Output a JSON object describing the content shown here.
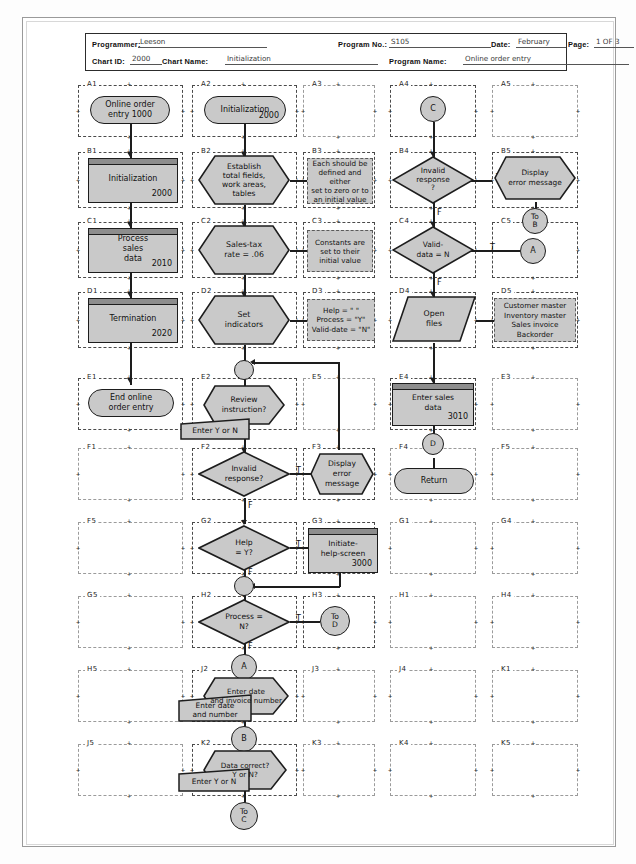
{
  "document": {
    "title": "Program Flowchart Worksheet",
    "sheet_border_color": "#9a9a9a"
  },
  "header": {
    "fields": [
      {
        "label": "Programmer:",
        "value": "Leeson"
      },
      {
        "label": "Program No.:",
        "value": "S105"
      },
      {
        "label": "Date:",
        "value": "February"
      },
      {
        "label": "Page:",
        "value": "1 OF 3"
      },
      {
        "label": "Chart ID:",
        "value": "2000"
      },
      {
        "label": "Chart Name:",
        "value": "Initialization"
      },
      {
        "label": "Program Name:",
        "value": "Online order entry"
      }
    ]
  },
  "palette": {
    "shape_fill": "#c9c9c9",
    "shape_stroke": "#1d1d1d",
    "header_bar": "#8d8d8d",
    "grid_dash": "#4a4a4a",
    "paper": "#ffffff"
  },
  "grid": {
    "rows": [
      "A",
      "B",
      "C",
      "D",
      "E",
      "F",
      "G",
      "H",
      "J",
      "K"
    ],
    "columns": [
      "1",
      "2",
      "3",
      "4",
      "5"
    ],
    "empty_cells": [
      "A3",
      "A5",
      "C5",
      "E3",
      "E5",
      "F1",
      "F5",
      "G1",
      "G4",
      "G5",
      "H1",
      "H4",
      "H5",
      "J1",
      "J3",
      "J4",
      "J5",
      "K1",
      "K3",
      "K4",
      "K5"
    ]
  },
  "shapes": {
    "a1": {
      "id": "A1",
      "type": "terminator",
      "text": "Online order\nentry 1000"
    },
    "b1": {
      "id": "B1",
      "type": "process",
      "text": "Initialization",
      "code": "2000"
    },
    "c1": {
      "id": "C1",
      "type": "process",
      "text": "Process\nsales\ndata",
      "code": "2010"
    },
    "d1": {
      "id": "D1",
      "type": "process",
      "text": "Termination",
      "code": "2020"
    },
    "e1": {
      "id": "E1",
      "type": "terminator",
      "text": "End online\norder entry"
    },
    "a2": {
      "id": "A2",
      "type": "terminator",
      "text": "Initialization",
      "code": "2000"
    },
    "b2": {
      "id": "B2",
      "type": "preparation",
      "text": "Establish\ntotal fields,\nwork areas,\ntables"
    },
    "b3": {
      "id": "B3",
      "type": "annotation",
      "text": "Each should be\ndefined and either\nset to zero or to\nan initial value"
    },
    "c2": {
      "id": "C2",
      "type": "preparation",
      "text": "Sales-tax\nrate = .06"
    },
    "c3": {
      "id": "C3",
      "type": "annotation",
      "text": "Constants are\nset to their\ninitial value"
    },
    "d2": {
      "id": "D2",
      "type": "preparation",
      "text": "Set\nindicators"
    },
    "d3": {
      "id": "D3",
      "type": "annotation",
      "text": "Help = \" \"\nProcess = \"Y\"\nValid-date = \"N\""
    },
    "e2": {
      "id": "E2",
      "type": "display",
      "text": "Review\ninstruction?"
    },
    "e2b": {
      "id": "E2-input",
      "type": "manual-input",
      "text": "Enter Y or N"
    },
    "f2": {
      "id": "F2",
      "type": "decision",
      "text": "Invalid\nresponse?"
    },
    "f3": {
      "id": "F3",
      "type": "display",
      "text": "Display\nerror\nmessage"
    },
    "g2": {
      "id": "G2",
      "type": "decision",
      "text": "Help\n= Y?"
    },
    "g3": {
      "id": "G3",
      "type": "process",
      "text": "Initiate-\nhelp-screen",
      "code": "3000"
    },
    "h2": {
      "id": "H2",
      "type": "decision",
      "text": "Process =\nN?"
    },
    "h3": {
      "id": "H3",
      "type": "connector",
      "text": "To\nD"
    },
    "j2": {
      "id": "J2",
      "type": "display",
      "text": "Enter date\nand invoice number"
    },
    "j2b": {
      "id": "J2-input",
      "type": "manual-input",
      "text": "Enter date\nand number"
    },
    "k2": {
      "id": "K2",
      "type": "display",
      "text": "Data correct?\nY or N?"
    },
    "k2b": {
      "id": "K2-input",
      "type": "manual-input",
      "text": "Enter Y or N"
    },
    "a4": {
      "id": "A4",
      "type": "connector",
      "text": "C"
    },
    "b4": {
      "id": "B4",
      "type": "decision",
      "text": "Invalid\nresponse\n?"
    },
    "b5": {
      "id": "B5",
      "type": "display",
      "text": "Display\nerror message"
    },
    "b5c": {
      "id": "B5-connector",
      "type": "connector",
      "text": "To\nB"
    },
    "c4": {
      "id": "C4",
      "type": "decision",
      "text": "Valid-\ndata = N"
    },
    "c5": {
      "id": "C5",
      "type": "connector",
      "text": "A"
    },
    "d4": {
      "id": "D4",
      "type": "input-output",
      "text": "Open\nfiles"
    },
    "d5": {
      "id": "D5",
      "type": "annotation",
      "text": "Customer master\nInventory master\nSales invoice\nBackorder"
    },
    "e4": {
      "id": "E4",
      "type": "process",
      "text": "Enter sales\ndata",
      "code": "3010"
    },
    "e4c": {
      "id": "E4-connector",
      "type": "connector",
      "text": "D"
    },
    "f4": {
      "id": "F4",
      "type": "terminator",
      "text": "Return"
    },
    "conn_d2e2": {
      "id": "conn-1",
      "type": "connector",
      "text": ""
    },
    "conn_g2h2": {
      "id": "conn-2",
      "type": "connector",
      "text": ""
    },
    "conn_a": {
      "id": "conn-A",
      "type": "connector",
      "text": "A"
    },
    "conn_b": {
      "id": "conn-B",
      "type": "connector",
      "text": "B"
    },
    "conn_toc": {
      "id": "conn-To-C",
      "type": "connector",
      "text": "To\nC"
    }
  },
  "branch_labels": {
    "f2_true": "T",
    "f2_false": "F",
    "g2_true": "T",
    "g2_false": "F",
    "h2_true": "T",
    "h2_false": "F",
    "b4_true": "T",
    "b4_false": "F",
    "c4_true": "T",
    "c4_false": "F"
  }
}
